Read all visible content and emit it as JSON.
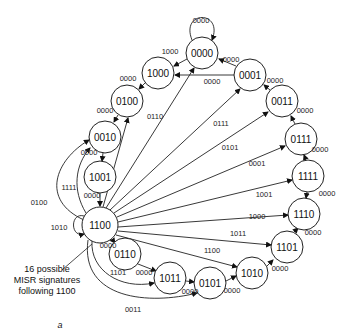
{
  "diagram": {
    "type": "state-diagram",
    "nodes": [
      {
        "id": "0000",
        "x": 202,
        "y": 53
      },
      {
        "id": "1000",
        "x": 158,
        "y": 73
      },
      {
        "id": "0100",
        "x": 127,
        "y": 101
      },
      {
        "id": "0010",
        "x": 105,
        "y": 137
      },
      {
        "id": "1001",
        "x": 100,
        "y": 177
      },
      {
        "id": "1100",
        "x": 100,
        "y": 225,
        "r": 18
      },
      {
        "id": "0001",
        "x": 250,
        "y": 75
      },
      {
        "id": "0011",
        "x": 282,
        "y": 101
      },
      {
        "id": "0111",
        "x": 301,
        "y": 139
      },
      {
        "id": "1111",
        "x": 308,
        "y": 176
      },
      {
        "id": "1110",
        "x": 304,
        "y": 214
      },
      {
        "id": "1101",
        "x": 287,
        "y": 247
      },
      {
        "id": "1010",
        "x": 252,
        "y": 273
      },
      {
        "id": "0101",
        "x": 210,
        "y": 283
      },
      {
        "id": "1011",
        "x": 170,
        "y": 278
      },
      {
        "id": "0110",
        "x": 125,
        "y": 254
      }
    ],
    "edges": [
      {
        "from": "0000",
        "to": "0000",
        "label": "0000",
        "self": true
      },
      {
        "from": "0000",
        "to": "1000",
        "label": "1000"
      },
      {
        "from": "1000",
        "to": "0100",
        "label": "0000"
      },
      {
        "from": "0100",
        "to": "0010",
        "label": "0000"
      },
      {
        "from": "0010",
        "to": "1001",
        "label": "0000"
      },
      {
        "from": "1001",
        "to": "1100",
        "label": "0000"
      },
      {
        "from": "0001",
        "to": "0000",
        "label": "0000"
      },
      {
        "from": "0001",
        "to": "1000",
        "label": "0000"
      },
      {
        "from": "0011",
        "to": "0001",
        "label": "0000"
      },
      {
        "from": "0111",
        "to": "0011",
        "label": "0000"
      },
      {
        "from": "1111",
        "to": "0111",
        "label": "0000"
      },
      {
        "from": "1110",
        "to": "1111",
        "label": "0000"
      },
      {
        "from": "1101",
        "to": "1110",
        "label": "0000"
      },
      {
        "from": "1010",
        "to": "1101",
        "label": "0000"
      },
      {
        "from": "0101",
        "to": "1010",
        "label": "0000"
      },
      {
        "from": "1011",
        "to": "0101",
        "label": "0000"
      },
      {
        "from": "0110",
        "to": "1011",
        "label": "0000"
      },
      {
        "from": "1100",
        "to": "0110",
        "label": "0000"
      },
      {
        "from": "1100",
        "to": "1100",
        "label": "1010",
        "self": true
      },
      {
        "from": "1100",
        "to": "0010",
        "label": "1111"
      },
      {
        "from": "1100",
        "to": "0010",
        "label": "0100"
      },
      {
        "from": "1100",
        "to": "0100",
        "label": "0110"
      },
      {
        "from": "1100",
        "to": "0000",
        "label": "0111"
      },
      {
        "from": "1100",
        "to": "0001",
        "label": "0101"
      },
      {
        "from": "1100",
        "to": "0011",
        "label": "0001"
      },
      {
        "from": "1100",
        "to": "0111",
        "label": "1001"
      },
      {
        "from": "1100",
        "to": "1111",
        "label": "1000"
      },
      {
        "from": "1100",
        "to": "1110",
        "label": "1011"
      },
      {
        "from": "1100",
        "to": "1101",
        "label": "1100"
      },
      {
        "from": "1100",
        "to": "1010",
        "label": "1101"
      },
      {
        "from": "1100",
        "to": "1011",
        "label": "0011"
      }
    ],
    "annotation": {
      "line1": "16 possible",
      "line2": "MISR signatures",
      "line3": "following 1100"
    },
    "caption": "a"
  }
}
